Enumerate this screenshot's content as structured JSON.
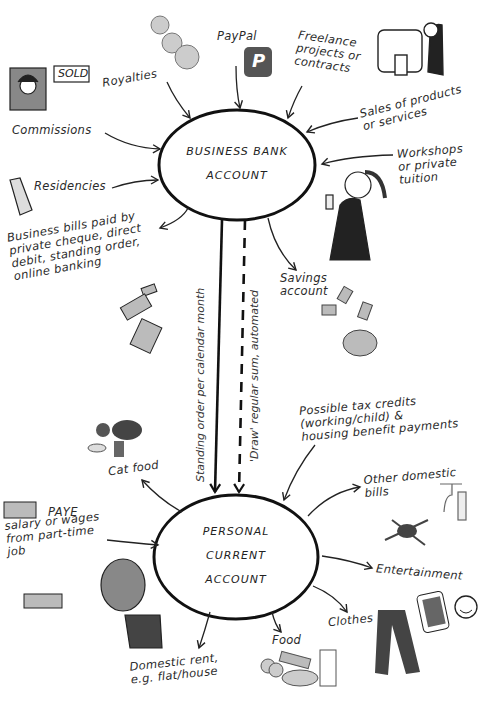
{
  "nodes": {
    "business": {
      "line1": "BUSINESS BANK",
      "line2": "ACCOUNT"
    },
    "personal": {
      "line1": "PERSONAL",
      "line2": "CURRENT",
      "line3": "ACCOUNT"
    }
  },
  "business_inflows": {
    "royalties": "Royalties",
    "paypal": "PayPal",
    "paypal_logo": "P",
    "freelance": "Freelance\nprojects or\ncontracts",
    "sales": "Sales of products\nor services",
    "workshops": "Workshops\nor private\ntuition",
    "commissions": "Commissions",
    "residencies": "Residencies",
    "sold_sign": "SOLD"
  },
  "business_outflows": {
    "bills": "Business bills paid by\nprivate cheque, direct\ndebit, standing order,\nonline banking",
    "savings": "Savings\naccount"
  },
  "transfers": {
    "standing_order": "Standing order per calendar month",
    "draw": "'Draw' regular sum, automated"
  },
  "personal_inflows": {
    "tax_credits": "Possible tax credits\n(working/child) &\nhousing benefit payments",
    "paye_title": "PAYE",
    "paye": "salary or wages\nfrom part-time\njob"
  },
  "personal_outflows": {
    "cat_food": "Cat food",
    "other_bills": "Other domestic\nbills",
    "entertainment": "Entertainment",
    "clothes": "Clothes",
    "food": "Food",
    "rent": "Domestic rent,\ne.g. flat/house"
  }
}
